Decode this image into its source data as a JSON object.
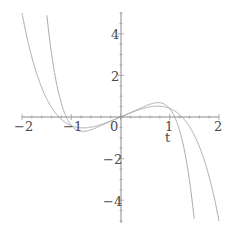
{
  "chart_data": {
    "type": "line",
    "title": "",
    "xlabel": "t",
    "ylabel": "",
    "xlim": [
      -2,
      2
    ],
    "ylim": [
      -5,
      5
    ],
    "grid": false,
    "legend": null,
    "x_ticks": [
      "-2",
      "-1",
      "0",
      "1",
      "2"
    ],
    "y_ticks": [
      "4",
      "2",
      "-2",
      "-4"
    ],
    "series": [
      {
        "name": "curve-inner",
        "description": "odd cubic-like curve, steeper; crosses zero near t=±1.1, reaches ±5 near t=∓1.5",
        "x": [
          -1.5,
          -1.25,
          -1.1,
          -0.85,
          -0.5,
          0,
          0.5,
          0.85,
          1.1,
          1.25,
          1.5
        ],
        "values": [
          5.0,
          2.0,
          0.0,
          -0.6,
          -0.4,
          0,
          0.4,
          0.55,
          0.0,
          -2.0,
          -5.0
        ]
      },
      {
        "name": "curve-outer",
        "description": "odd cubic-like curve, flatter; crosses zero near t=±1.25, reaches ±5 near t=∓2",
        "x": [
          -2.0,
          -1.75,
          -1.5,
          -1.25,
          -0.85,
          -0.5,
          0,
          0.5,
          0.85,
          1.25,
          1.5,
          1.75,
          2.0
        ],
        "values": [
          5.0,
          2.6,
          1.0,
          0.0,
          -0.55,
          -0.4,
          0,
          0.4,
          0.55,
          0.0,
          -1.0,
          -2.6,
          -5.0
        ]
      }
    ]
  },
  "axes": {
    "x_label": "t",
    "x_tick_labels": [
      "-2",
      "-1",
      "0",
      "1",
      "2"
    ],
    "y_tick_labels_pos": [
      "4",
      "2"
    ],
    "y_tick_labels_neg": [
      "-2",
      "-4"
    ]
  },
  "colors": {
    "curve": "#a8a8a8",
    "axis": "#8a8a8a",
    "label": "#4a4a4a"
  }
}
